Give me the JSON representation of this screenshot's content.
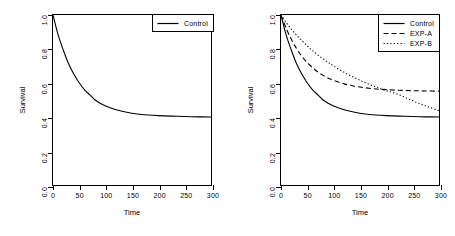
{
  "figure": {
    "background": "#ffffff",
    "line_color": "#000000",
    "panels": [
      {
        "id": "left",
        "axis_title_x": "Time",
        "axis_title_y": "Survival",
        "legend_position": "top-right",
        "legend": [
          {
            "label": "Control",
            "style": "solid"
          }
        ]
      },
      {
        "id": "right",
        "axis_title_x": "Time",
        "axis_title_y": "Survival",
        "legend_position": "top-right",
        "legend": [
          {
            "label": "Control",
            "style": "solid"
          },
          {
            "label": "EXP-A",
            "style": "dashed"
          },
          {
            "label": "EXP-B",
            "style": "dotted"
          }
        ]
      }
    ]
  },
  "chart_data": [
    {
      "type": "line",
      "panel": "left",
      "title": "",
      "xlabel": "Time",
      "ylabel": "Survival",
      "xlim": [
        0,
        300
      ],
      "ylim": [
        0.0,
        1.0
      ],
      "xticks": [
        0,
        50,
        100,
        150,
        200,
        250,
        300
      ],
      "yticks": [
        0.0,
        0.2,
        0.4,
        0.6,
        0.8,
        1.0
      ],
      "grid": false,
      "legend_position": "top-right",
      "x": [
        0,
        10,
        20,
        30,
        40,
        50,
        60,
        70,
        80,
        90,
        100,
        120,
        140,
        160,
        180,
        200,
        225,
        250,
        275,
        300
      ],
      "series": [
        {
          "name": "Control",
          "style": "solid",
          "color": "#000000",
          "asymptote": 0.4,
          "values": [
            1.0,
            0.88,
            0.79,
            0.71,
            0.65,
            0.6,
            0.56,
            0.53,
            0.5,
            0.48,
            0.465,
            0.443,
            0.428,
            0.418,
            0.412,
            0.408,
            0.405,
            0.403,
            0.401,
            0.4
          ]
        }
      ]
    },
    {
      "type": "line",
      "panel": "right",
      "title": "",
      "xlabel": "Time",
      "ylabel": "Survival",
      "xlim": [
        0,
        300
      ],
      "ylim": [
        0.0,
        1.0
      ],
      "xticks": [
        0,
        50,
        100,
        150,
        200,
        250,
        300
      ],
      "yticks": [
        0.0,
        0.2,
        0.4,
        0.6,
        0.8,
        1.0
      ],
      "grid": false,
      "legend_position": "top-right",
      "x": [
        0,
        10,
        20,
        30,
        40,
        50,
        60,
        70,
        80,
        90,
        100,
        120,
        140,
        160,
        180,
        200,
        225,
        250,
        275,
        300
      ],
      "series": [
        {
          "name": "Control",
          "style": "solid",
          "color": "#000000",
          "asymptote": 0.4,
          "values": [
            1.0,
            0.88,
            0.79,
            0.71,
            0.65,
            0.6,
            0.56,
            0.53,
            0.5,
            0.48,
            0.465,
            0.443,
            0.428,
            0.418,
            0.412,
            0.408,
            0.405,
            0.403,
            0.401,
            0.4
          ]
        },
        {
          "name": "EXP-A",
          "style": "dashed",
          "color": "#000000",
          "asymptote": 0.55,
          "values": [
            1.0,
            0.92,
            0.855,
            0.8,
            0.755,
            0.72,
            0.69,
            0.665,
            0.645,
            0.628,
            0.615,
            0.595,
            0.581,
            0.572,
            0.565,
            0.561,
            0.557,
            0.555,
            0.553,
            0.552
          ]
        },
        {
          "name": "EXP-B",
          "style": "dotted",
          "color": "#000000",
          "asymptote": 0.4,
          "values": [
            1.0,
            0.955,
            0.915,
            0.88,
            0.848,
            0.818,
            0.79,
            0.765,
            0.742,
            0.72,
            0.7,
            0.663,
            0.631,
            0.602,
            0.577,
            0.555,
            0.53,
            0.495,
            0.465,
            0.437
          ]
        }
      ],
      "annotations": [
        {
          "text": "EXP-B crosses below EXP-A near Time = 130",
          "x": 130,
          "y": 0.62
        }
      ]
    }
  ]
}
